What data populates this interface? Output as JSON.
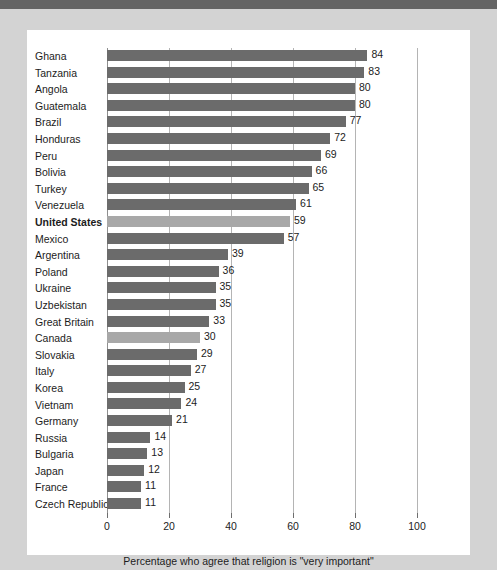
{
  "chart_data": {
    "type": "bar",
    "orientation": "horizontal",
    "title": "",
    "xlabel": "Percentage who agree that religion is \"very important\"",
    "ylabel": "",
    "xlim": [
      0,
      100
    ],
    "xticks": [
      0,
      20,
      40,
      60,
      80,
      100
    ],
    "xticklabels": [
      "0",
      "20",
      "40",
      "60",
      "80",
      "100"
    ],
    "grid": true,
    "grid_axis": "x",
    "legend": null,
    "colors": {
      "bar": "#6b6b6b",
      "bar_highlight": "#a8a8a8",
      "panel": "#ffffff",
      "page": "#d3d3d3",
      "top_band": "#646464",
      "gridline": "#b4b4b4",
      "text": "#1c1c1c"
    },
    "categories": [
      "Ghana",
      "Tanzania",
      "Angola",
      "Guatemala",
      "Brazil",
      "Honduras",
      "Peru",
      "Bolivia",
      "Turkey",
      "Venezuela",
      "United States",
      "Mexico",
      "Argentina",
      "Poland",
      "Ukraine",
      "Uzbekistan",
      "Great Britain",
      "Canada",
      "Slovakia",
      "Italy",
      "Korea",
      "Vietnam",
      "Germany",
      "Russia",
      "Bulgaria",
      "Japan",
      "France",
      "Czech Republic"
    ],
    "values": [
      84,
      83,
      80,
      80,
      77,
      72,
      69,
      66,
      65,
      61,
      59,
      57,
      39,
      36,
      35,
      35,
      33,
      30,
      29,
      27,
      25,
      24,
      21,
      14,
      13,
      12,
      11,
      11
    ],
    "highlighted": [
      "United States",
      "Canada"
    ],
    "bold_labels": [
      "United States"
    ],
    "bars": [
      {
        "label": "Ghana",
        "value": 84,
        "highlight": false,
        "bold": false
      },
      {
        "label": "Tanzania",
        "value": 83,
        "highlight": false,
        "bold": false
      },
      {
        "label": "Angola",
        "value": 80,
        "highlight": false,
        "bold": false
      },
      {
        "label": "Guatemala",
        "value": 80,
        "highlight": false,
        "bold": false
      },
      {
        "label": "Brazil",
        "value": 77,
        "highlight": false,
        "bold": false
      },
      {
        "label": "Honduras",
        "value": 72,
        "highlight": false,
        "bold": false
      },
      {
        "label": "Peru",
        "value": 69,
        "highlight": false,
        "bold": false
      },
      {
        "label": "Bolivia",
        "value": 66,
        "highlight": false,
        "bold": false
      },
      {
        "label": "Turkey",
        "value": 65,
        "highlight": false,
        "bold": false
      },
      {
        "label": "Venezuela",
        "value": 61,
        "highlight": false,
        "bold": false
      },
      {
        "label": "United States",
        "value": 59,
        "highlight": true,
        "bold": true
      },
      {
        "label": "Mexico",
        "value": 57,
        "highlight": false,
        "bold": false
      },
      {
        "label": "Argentina",
        "value": 39,
        "highlight": false,
        "bold": false
      },
      {
        "label": "Poland",
        "value": 36,
        "highlight": false,
        "bold": false
      },
      {
        "label": "Ukraine",
        "value": 35,
        "highlight": false,
        "bold": false
      },
      {
        "label": "Uzbekistan",
        "value": 35,
        "highlight": false,
        "bold": false
      },
      {
        "label": "Great Britain",
        "value": 33,
        "highlight": false,
        "bold": false
      },
      {
        "label": "Canada",
        "value": 30,
        "highlight": true,
        "bold": false
      },
      {
        "label": "Slovakia",
        "value": 29,
        "highlight": false,
        "bold": false
      },
      {
        "label": "Italy",
        "value": 27,
        "highlight": false,
        "bold": false
      },
      {
        "label": "Korea",
        "value": 25,
        "highlight": false,
        "bold": false
      },
      {
        "label": "Vietnam",
        "value": 24,
        "highlight": false,
        "bold": false
      },
      {
        "label": "Germany",
        "value": 21,
        "highlight": false,
        "bold": false
      },
      {
        "label": "Russia",
        "value": 14,
        "highlight": false,
        "bold": false
      },
      {
        "label": "Bulgaria",
        "value": 13,
        "highlight": false,
        "bold": false
      },
      {
        "label": "Japan",
        "value": 12,
        "highlight": false,
        "bold": false
      },
      {
        "label": "France",
        "value": 11,
        "highlight": false,
        "bold": false
      },
      {
        "label": "Czech Republic",
        "value": 11,
        "highlight": false,
        "bold": false
      }
    ]
  }
}
